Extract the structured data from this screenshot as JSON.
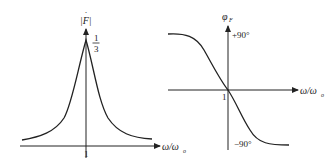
{
  "figure": {
    "left_plot": {
      "title": "Amplitude-frequency response",
      "y_label": "|F|",
      "y_label_accent": "·",
      "peak_label_num": "1",
      "peak_label_den": "3",
      "x_label": "ω/ω",
      "x_label_sub": "o",
      "x_tick": "1"
    },
    "right_plot": {
      "title": "Phase-frequency response",
      "y_label": "φ",
      "y_label_sub": "F",
      "top_label": "+90°",
      "bottom_label": "−90°",
      "x_label": "ω/ω",
      "x_label_sub": "o",
      "origin_tick": "1"
    },
    "colors": {
      "line": "#222222",
      "background": "#ffffff"
    }
  }
}
